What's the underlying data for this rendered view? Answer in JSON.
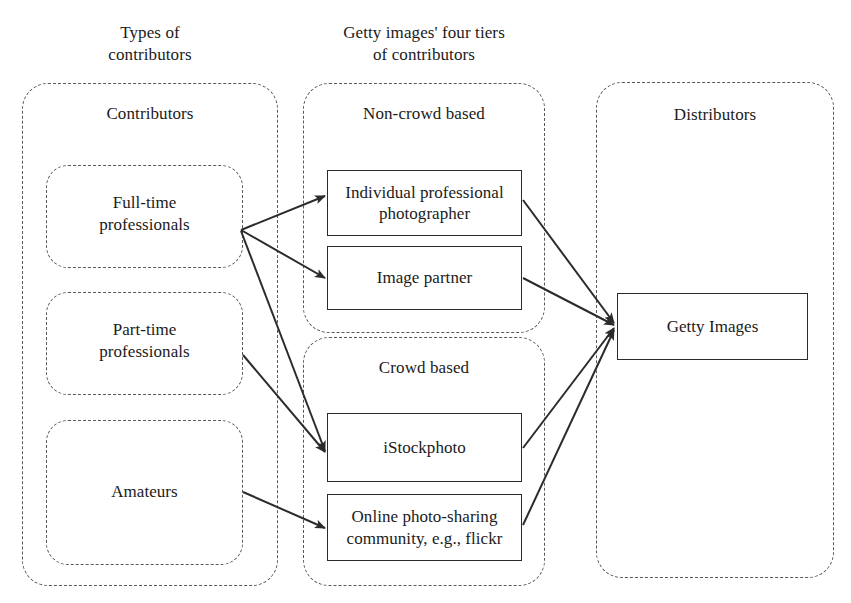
{
  "diagram": {
    "title": "Getty images' four tiers of contributors",
    "width": 851,
    "height": 603,
    "background": "#ffffff",
    "line_color": "#2b2b2b",
    "dashed_color": "#555a5f",
    "text_color": "#1b1b1b"
  },
  "columns": [
    {
      "id": "types-of-contributors",
      "heading": "Types of\ncontributors"
    },
    {
      "id": "getty-tiers",
      "heading": "Getty images' four tiers\nof contributors"
    },
    {
      "id": "distributors",
      "heading": ""
    }
  ],
  "headings": {
    "types_line1": "Types of",
    "types_line2": "contributors",
    "tiers_line1": "Getty images' four tiers",
    "tiers_line2": "of contributors"
  },
  "groups": {
    "contributors": {
      "label": "Contributors",
      "nodes": [
        {
          "id": "full-time-professionals",
          "line1": "Full-time",
          "line2": "professionals"
        },
        {
          "id": "part-time-professionals",
          "line1": "Part-time",
          "line2": "professionals"
        },
        {
          "id": "amateurs",
          "line1": "Amateurs",
          "line2": ""
        }
      ]
    },
    "non_crowd_based": {
      "label": "Non-crowd based",
      "nodes": [
        {
          "id": "individual-professional-photographer",
          "line1": "Individual professional",
          "line2": "photographer"
        },
        {
          "id": "image-partner",
          "line1": "Image partner",
          "line2": ""
        }
      ]
    },
    "crowd_based": {
      "label": "Crowd based",
      "nodes": [
        {
          "id": "istockphoto",
          "line1": "iStockphoto",
          "line2": ""
        },
        {
          "id": "online-photo-sharing-community",
          "line1": "Online photo-sharing",
          "line2": "community, e.g., flickr"
        }
      ]
    },
    "distributors": {
      "label": "Distributors",
      "nodes": [
        {
          "id": "getty-images",
          "line1": "Getty Images",
          "line2": ""
        }
      ]
    }
  },
  "edges": [
    {
      "from": "full-time-professionals",
      "to": "individual-professional-photographer"
    },
    {
      "from": "full-time-professionals",
      "to": "image-partner"
    },
    {
      "from": "full-time-professionals",
      "to": "istockphoto"
    },
    {
      "from": "part-time-professionals",
      "to": "istockphoto"
    },
    {
      "from": "amateurs",
      "to": "online-photo-sharing-community"
    },
    {
      "from": "individual-professional-photographer",
      "to": "getty-images"
    },
    {
      "from": "image-partner",
      "to": "getty-images"
    },
    {
      "from": "istockphoto",
      "to": "getty-images"
    },
    {
      "from": "online-photo-sharing-community",
      "to": "getty-images"
    }
  ]
}
